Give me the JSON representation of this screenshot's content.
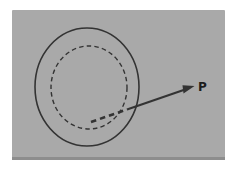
{
  "figure": {
    "point_label": "P",
    "colors": {
      "canvas_bg": "#ffffff",
      "panel_bg": "#a9a9a9",
      "panel_edge_shadow": "#8d8d8d",
      "line": "#333333",
      "label": "#1c1c1c"
    }
  }
}
